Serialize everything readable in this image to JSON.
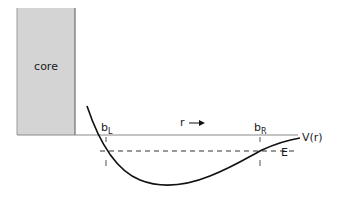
{
  "diagram": {
    "core_label": "core",
    "left_turning_point": {
      "base": "b",
      "sub": "L"
    },
    "right_turning_point": {
      "base": "b",
      "sub": "R"
    },
    "r_axis_label": "r",
    "potential_label": "V(r)",
    "energy_label": "E",
    "colors": {
      "core_fill": "#d4d4d4",
      "core_stroke": "#555555",
      "baseline": "#8a8a8a",
      "curve": "#111111",
      "dashed": "#333333"
    }
  }
}
